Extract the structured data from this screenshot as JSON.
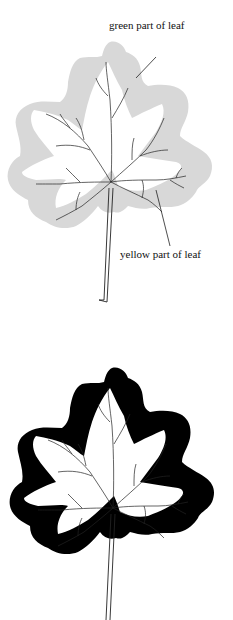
{
  "figure_top": {
    "outer_fill": "#d8d8d8",
    "labels": {
      "green": "green part of leaf",
      "yellow": "yellow part of leaf"
    }
  },
  "figure_bottom": {
    "outer_fill": "#000000"
  }
}
